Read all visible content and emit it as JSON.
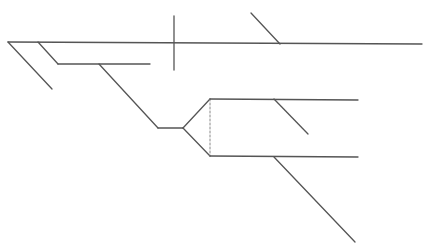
{
  "diagram": {
    "type": "line-structure",
    "background": "#ffffff",
    "stroke": "#555555",
    "stroke_width": 1.3,
    "lines": [
      {
        "name": "main-horizontal",
        "x1": 8,
        "y1": 42,
        "x2": 422,
        "y2": 44,
        "dashed": false
      },
      {
        "name": "left-diagonal-branch",
        "x1": 8,
        "y1": 42,
        "x2": 52,
        "y2": 89,
        "dashed": false
      },
      {
        "name": "inner-diagonal",
        "x1": 38,
        "y1": 42,
        "x2": 58,
        "y2": 64,
        "dashed": false
      },
      {
        "name": "inner-horizontal",
        "x1": 58,
        "y1": 64,
        "x2": 150,
        "y2": 64,
        "dashed": false
      },
      {
        "name": "vertical-cross",
        "x1": 174,
        "y1": 16,
        "x2": 174,
        "y2": 70,
        "dashed": false
      },
      {
        "name": "top-right-diagonal",
        "x1": 251,
        "y1": 13,
        "x2": 280,
        "y2": 44,
        "dashed": false
      },
      {
        "name": "long-diagonal",
        "x1": 99,
        "y1": 64,
        "x2": 158,
        "y2": 128,
        "dashed": false
      },
      {
        "name": "short-horizontal",
        "x1": 158,
        "y1": 128,
        "x2": 183,
        "y2": 128,
        "dashed": false
      },
      {
        "name": "fork-up",
        "x1": 183,
        "y1": 128,
        "x2": 210,
        "y2": 99,
        "dashed": false
      },
      {
        "name": "fork-down",
        "x1": 183,
        "y1": 128,
        "x2": 210,
        "y2": 156,
        "dashed": false
      },
      {
        "name": "dashed-connector",
        "x1": 210,
        "y1": 99,
        "x2": 210,
        "y2": 156,
        "dashed": true
      },
      {
        "name": "upper-right-horizontal",
        "x1": 210,
        "y1": 99,
        "x2": 358,
        "y2": 100,
        "dashed": false
      },
      {
        "name": "upper-right-branch",
        "x1": 274,
        "y1": 99,
        "x2": 308,
        "y2": 134,
        "dashed": false
      },
      {
        "name": "lower-right-horizontal",
        "x1": 210,
        "y1": 156,
        "x2": 358,
        "y2": 157,
        "dashed": false
      },
      {
        "name": "lower-right-branch",
        "x1": 274,
        "y1": 157,
        "x2": 355,
        "y2": 242,
        "dashed": false
      }
    ]
  }
}
